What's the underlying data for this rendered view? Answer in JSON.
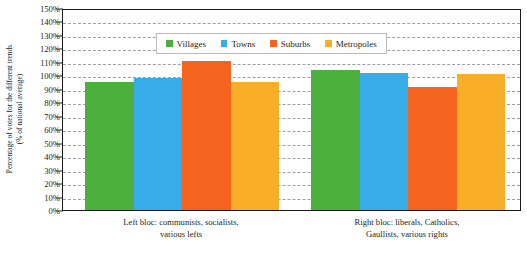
{
  "chart_data": {
    "type": "bar",
    "title": "",
    "xlabel": "",
    "ylabel": "Percentage of votes for the different trends (% of national average)",
    "ylabel_line1": "Percentage of votes for the different trends",
    "ylabel_line2": "(% of national average)",
    "ylim": [
      0,
      150
    ],
    "ytick_step": 10,
    "ytick_labels": [
      "0%",
      "10%",
      "20%",
      "30%",
      "40%",
      "50%",
      "60%",
      "70%",
      "80%",
      "90%",
      "100%",
      "110%",
      "120%",
      "130%",
      "140%",
      "150%"
    ],
    "ytick_values": [
      0,
      10,
      20,
      30,
      40,
      50,
      60,
      70,
      80,
      90,
      100,
      110,
      120,
      130,
      140,
      150
    ],
    "grid": true,
    "grid_style": "dashed",
    "legend_position": "top-center",
    "categories": [
      "Left bloc: communists, socialists, various lefts",
      "Right bloc: liberals, Catholics, Gaullists, various rights"
    ],
    "category_label_lines": [
      [
        "Left bloc: communists, socialists,",
        "various lefts"
      ],
      [
        "Right bloc: liberals, Catholics,",
        "Gaullists, various rights"
      ]
    ],
    "series": [
      {
        "name": "Villages",
        "color": "#4CAF3E",
        "values": [
          95,
          104
        ]
      },
      {
        "name": "Towns",
        "color": "#36ACE8",
        "values": [
          98,
          102
        ]
      },
      {
        "name": "Suburbs",
        "color": "#F4641E",
        "values": [
          111,
          91
        ]
      },
      {
        "name": "Metropoles",
        "color": "#F9AE2A",
        "values": [
          95,
          101
        ]
      }
    ]
  },
  "legend": {
    "entries": [
      {
        "label": "Villages",
        "color": "#4CAF3E"
      },
      {
        "label": "Towns",
        "color": "#36ACE8"
      },
      {
        "label": "Suburbs",
        "color": "#F4641E"
      },
      {
        "label": "Metropoles",
        "color": "#F9AE2A"
      }
    ]
  },
  "axes": {
    "frame_color": "#1a1a1a",
    "gridline_color": "#9b9fa6"
  }
}
